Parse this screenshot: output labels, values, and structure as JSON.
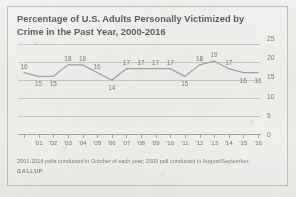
{
  "figure": {
    "title": "Percentage of U.S. Adults Personally Victimized by Crime in the Past Year, 2000-2016",
    "note": "2001-2016 polls conducted in October of each year; 2000 poll conducted in August/September.",
    "source": "GALLUP",
    "line_color": "#9aa3ab",
    "text_color": "#78776f",
    "frame_color": "#787876"
  },
  "chart_data": {
    "type": "line",
    "title": "Percentage of U.S. Adults Personally Victimized by Crime in the Past Year, 2000-2016",
    "xlabel": "",
    "ylabel": "",
    "ylim": [
      0,
      25
    ],
    "yticks": [
      0,
      5,
      10,
      15,
      20,
      25
    ],
    "ytick_labels": [
      "0",
      "5",
      "10",
      "15",
      "20",
      "25"
    ],
    "grid": true,
    "legend": "none",
    "x": [
      "'00",
      "'01",
      "'02",
      "'03",
      "'04",
      "'05",
      "'06",
      "'07",
      "'08",
      "'09",
      "'10",
      "'11",
      "'12",
      "'13",
      "'14",
      "'15",
      "'16"
    ],
    "xtick_labels": [
      "",
      "'01",
      "'02",
      "'03",
      "'04",
      "'05",
      "'06",
      "'07",
      "'08",
      "'09",
      "'10",
      "'11",
      "'12",
      "'13",
      "'14",
      "'15",
      "'16"
    ],
    "categories": [
      "2000",
      "2001",
      "2002",
      "2003",
      "2004",
      "2005",
      "2006",
      "2007",
      "2008",
      "2009",
      "2010",
      "2011",
      "2012",
      "2013",
      "2014",
      "2015",
      "2016"
    ],
    "values": [
      16,
      15,
      15,
      18,
      18,
      16,
      14,
      17,
      17,
      17,
      17,
      15,
      18,
      19,
      17,
      16,
      16
    ],
    "point_labels": [
      "16",
      "15",
      "15",
      "18",
      "18",
      "16",
      "14",
      "17",
      "17",
      "17",
      "17",
      "15",
      "18",
      "19",
      "17",
      "16",
      "16"
    ],
    "label_positions": [
      "above",
      "below",
      "below",
      "above",
      "above",
      "above",
      "below",
      "above",
      "above",
      "above",
      "above",
      "below",
      "above",
      "above",
      "above",
      "below",
      "below"
    ]
  }
}
